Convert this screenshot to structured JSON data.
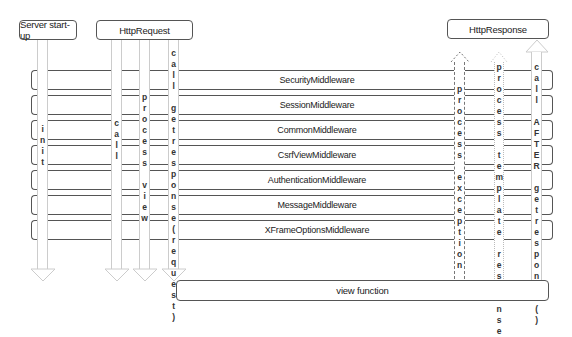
{
  "top_boxes": {
    "server_startup": "Server start-up",
    "http_request": "HttpRequest",
    "http_response": "HttpResponse"
  },
  "middlewares": [
    "SecurityMiddleware",
    "SessionMiddleware",
    "CommonMiddleware",
    "CsrfViewMiddleware",
    "AuthenticationMiddleware",
    "MessageMiddleware",
    "XFrameOptionsMiddleware"
  ],
  "view_function": "view function",
  "arrows": {
    "init": "init",
    "call": "call",
    "process_view": "process view",
    "call_getresponse": "call getresponse(request)",
    "process_exception": "process exception",
    "process_template_response": "process template response",
    "call_after_getresponse": "call AFTER getresponse()"
  }
}
